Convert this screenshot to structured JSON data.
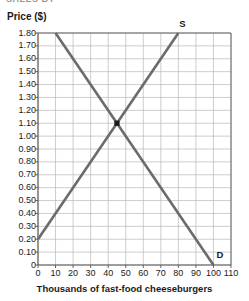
{
  "top_clip_text": "SALES BY",
  "axes": {
    "y_title": "Price ($)",
    "x_title": "Thousands of fast-food cheeseburgers"
  },
  "labels": {
    "supply": "S",
    "demand": "D"
  },
  "chart_data": {
    "type": "line",
    "title": "",
    "xlabel": "Thousands of fast-food cheeseburgers",
    "ylabel": "Price ($)",
    "xlim": [
      0,
      110
    ],
    "ylim": [
      0,
      1.8
    ],
    "xticks": [
      0,
      10,
      20,
      30,
      40,
      50,
      60,
      70,
      80,
      90,
      100,
      110
    ],
    "yticks": [
      0,
      0.1,
      0.2,
      0.3,
      0.4,
      0.5,
      0.6,
      0.7,
      0.8,
      0.9,
      1.0,
      1.1,
      1.2,
      1.3,
      1.4,
      1.5,
      1.6,
      1.7,
      1.8
    ],
    "xtick_labels": [
      "0",
      "10",
      "20",
      "30",
      "40",
      "50",
      "60",
      "70",
      "80",
      "90",
      "100",
      "110"
    ],
    "ytick_labels": [
      "0",
      "0.10",
      "0.20",
      "0.30",
      "0.40",
      "0.50",
      "0.60",
      "0.70",
      "0.80",
      "0.90",
      "1.00",
      "1.10",
      "1.20",
      "1.30",
      "1.40",
      "1.50",
      "1.60",
      "1.70",
      "1.80"
    ],
    "grid": true,
    "legend": "none",
    "line_color": "#6b6b6b",
    "grid_color": "#b8b8b8",
    "axis_color": "#555555",
    "series": [
      {
        "name": "S",
        "label": "S",
        "type": "supply",
        "points": [
          [
            0,
            0.2
          ],
          [
            80,
            1.8
          ]
        ]
      },
      {
        "name": "D",
        "label": "D",
        "type": "demand",
        "points": [
          [
            10,
            1.8
          ],
          [
            100,
            0.0
          ]
        ]
      }
    ],
    "annotations": [
      {
        "name": "equilibrium-point",
        "x": 45,
        "y": 1.1,
        "marker": "square",
        "color": "#1a1a1a"
      }
    ]
  }
}
